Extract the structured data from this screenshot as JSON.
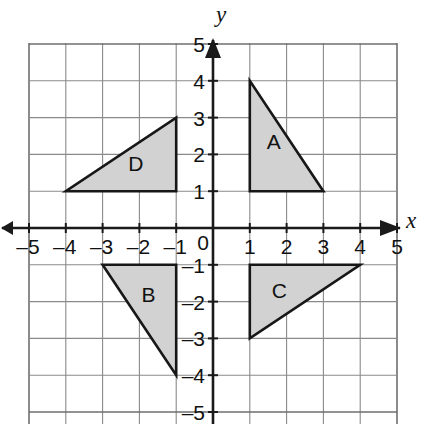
{
  "figure": {
    "background_color": "#ffffff"
  },
  "chart_data": {
    "type": "scatter",
    "title": "",
    "subtitle": "",
    "xlabel": "x",
    "ylabel": "y",
    "xlim": [
      -5,
      5
    ],
    "ylim": [
      -5,
      5
    ],
    "grid": true,
    "grid_step": 1,
    "legend_position": "none",
    "axis_style": {
      "arrows": [
        "x-positive",
        "x-negative",
        "y-positive"
      ],
      "origin_label": "0",
      "tick_color": "#111111",
      "grid_color": "#8a8a8a",
      "axis_color": "#1a1a1a"
    },
    "xticks": [
      -5,
      -4,
      -3,
      -2,
      -1,
      1,
      2,
      3,
      4,
      5
    ],
    "xtick_labels": [
      "–5",
      "–4",
      "–3",
      "–2",
      "–1",
      "1",
      "2",
      "3",
      "4",
      "5"
    ],
    "yticks": [
      -5,
      -4,
      -3,
      -2,
      -1,
      1,
      2,
      3,
      4,
      5
    ],
    "ytick_labels": [
      "–5",
      "–4",
      "–3",
      "–2",
      "–1",
      "1",
      "2",
      "3",
      "4",
      "5"
    ],
    "shapes": [
      {
        "label": "A",
        "kind": "right-triangle",
        "fill": "#d2d2d2",
        "stroke": "#171717",
        "vertices": [
          [
            1,
            4
          ],
          [
            1,
            1
          ],
          [
            3,
            1
          ]
        ],
        "label_point": [
          1.65,
          2.3
        ],
        "quadrant": "I"
      },
      {
        "label": "C",
        "kind": "right-triangle",
        "fill": "#d2d2d2",
        "stroke": "#171717",
        "vertices": [
          [
            1,
            -1
          ],
          [
            4,
            -1
          ],
          [
            1,
            -3
          ]
        ],
        "label_point": [
          1.8,
          -1.75
        ],
        "quadrant": "IV"
      },
      {
        "label": "B",
        "kind": "right-triangle",
        "fill": "#d2d2d2",
        "stroke": "#171717",
        "vertices": [
          [
            -3,
            -1
          ],
          [
            -1,
            -1
          ],
          [
            -1,
            -4
          ]
        ],
        "label_point": [
          -1.75,
          -1.85
        ],
        "quadrant": "III"
      },
      {
        "label": "D",
        "kind": "right-triangle",
        "fill": "#d2d2d2",
        "stroke": "#171717",
        "vertices": [
          [
            -4,
            1
          ],
          [
            -1,
            1
          ],
          [
            -1,
            3
          ]
        ],
        "label_point": [
          -2.1,
          1.7
        ],
        "quadrant": "II"
      }
    ]
  },
  "geometry": {
    "origin_px": [
      213.0,
      228.0
    ],
    "cell_px": 36.8,
    "grid_left_px": 29.0,
    "grid_top_px": 43.0,
    "grid_right_px": 397.0,
    "grid_bottom_px": 424.0
  }
}
